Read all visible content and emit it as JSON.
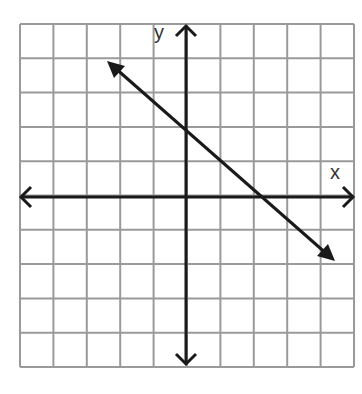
{
  "chart_data": {
    "type": "line",
    "title": "",
    "xlabel": "x",
    "ylabel": "y",
    "grid": true,
    "xlim": [
      -5,
      5
    ],
    "ylim": [
      -5,
      5
    ],
    "tick_labels": false,
    "series": [
      {
        "name": "line",
        "equation": "y = -x + 2",
        "slope": -1,
        "y_intercept": 2,
        "x_intercept": 2,
        "points": [
          [
            -2.3,
            4.0
          ],
          [
            0,
            2
          ],
          [
            1,
            1
          ],
          [
            2,
            0
          ],
          [
            4.4,
            -1.9
          ]
        ],
        "arrows_both_ends": true
      }
    ]
  },
  "labels": {
    "x_axis": "x",
    "y_axis": "y"
  },
  "colors": {
    "grid": "#9a9a9a",
    "axes": "#1a1a1a",
    "line": "#1a1a1a"
  }
}
